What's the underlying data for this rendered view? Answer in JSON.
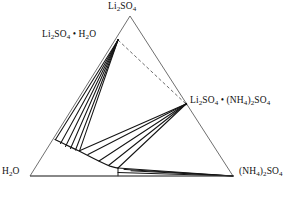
{
  "diagram": {
    "kind": "ternary-phase-diagram",
    "background_color": "#ffffff",
    "line_color": "#1a1a1a",
    "outline_color": "#4a4a4a",
    "dashed_color": "#555555",
    "vertices": {
      "top": {
        "id": "li2so4",
        "label_html": "Li<sub>2</sub>SO<sub>4</sub>",
        "x": 130,
        "y": 16
      },
      "bottom_left": {
        "id": "h2o",
        "label_html": "H<sub>2</sub>O",
        "x": 30,
        "y": 176
      },
      "bottom_right": {
        "id": "nh42so4",
        "label_html": "(NH<sub>4</sub>)<sub>2</sub>SO<sub>4</sub>",
        "x": 233,
        "y": 176
      }
    },
    "compounds": {
      "hydrate": {
        "id": "li2so4-h2o",
        "label_html": "Li<sub>2</sub>SO<sub>4</sub> &bull; H<sub>2</sub>O",
        "x": 118,
        "y": 40
      },
      "double_salt": {
        "id": "li2so4-nh42so4",
        "label_html": "Li<sub>2</sub>SO<sub>4</sub> &bull; (NH<sub>4</sub>)<sub>2</sub>SO<sub>4</sub>",
        "x": 186,
        "y": 104
      }
    },
    "caption_fragment": ""
  },
  "chart_data": {
    "type": "scatter",
    "title": "",
    "xlabel": "",
    "ylabel": "",
    "components": [
      "Li2SO4",
      "H2O",
      "(NH4)2SO4"
    ],
    "triangle": {
      "top": [
        130,
        16
      ],
      "left": [
        30,
        176
      ],
      "right": [
        233,
        176
      ]
    },
    "points": [
      {
        "name": "Li2SO4",
        "x": 130,
        "y": 16
      },
      {
        "name": "Li2SO4 . H2O",
        "x": 118,
        "y": 40
      },
      {
        "name": "Li2SO4 . (NH4)2SO4",
        "x": 186,
        "y": 104
      },
      {
        "name": "H2O",
        "x": 30,
        "y": 176
      },
      {
        "name": "(NH4)2SO4",
        "x": 233,
        "y": 176
      }
    ],
    "solubility_curve_upper": [
      [
        55,
        140
      ],
      [
        62,
        144
      ],
      [
        69,
        147
      ],
      [
        76,
        149
      ],
      [
        82,
        151
      ],
      [
        88,
        154
      ],
      [
        94,
        158
      ],
      [
        100,
        162
      ],
      [
        108,
        166
      ],
      [
        118,
        168
      ]
    ],
    "solubility_curve_lower": [
      [
        118,
        168
      ],
      [
        150,
        172
      ],
      [
        185,
        174
      ],
      [
        233,
        176
      ]
    ],
    "tie_lines_from_hydrate": [
      [
        [
          118,
          40
        ],
        [
          55,
          140
        ]
      ],
      [
        [
          118,
          40
        ],
        [
          61,
          144
        ]
      ],
      [
        [
          118,
          40
        ],
        [
          67,
          147
        ]
      ],
      [
        [
          118,
          40
        ],
        [
          72,
          149
        ]
      ],
      [
        [
          118,
          40
        ],
        [
          78,
          150
        ]
      ]
    ],
    "tie_lines_from_double_salt": [
      [
        [
          186,
          104
        ],
        [
          78,
          150
        ]
      ],
      [
        [
          186,
          104
        ],
        [
          88,
          154
        ]
      ],
      [
        [
          186,
          104
        ],
        [
          99,
          161
        ]
      ],
      [
        [
          186,
          104
        ],
        [
          108,
          166
        ]
      ],
      [
        [
          186,
          104
        ],
        [
          118,
          168
        ]
      ]
    ],
    "tie_lines_from_nh42so4": [
      [
        [
          233,
          176
        ],
        [
          118,
          168
        ]
      ],
      [
        [
          233,
          176
        ],
        [
          128,
          170
        ]
      ],
      [
        [
          233,
          176
        ],
        [
          140,
          172
        ]
      ]
    ],
    "dashed_join": [
      [
        118,
        40
      ],
      [
        186,
        104
      ]
    ],
    "invariant_tick": [
      [
        118,
        168
      ],
      [
        118,
        176
      ]
    ],
    "grid": false,
    "legend": "none"
  }
}
